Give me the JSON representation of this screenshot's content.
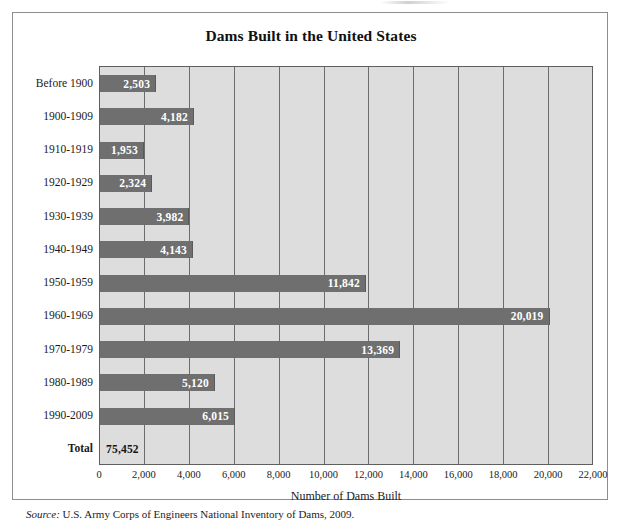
{
  "figure": {
    "title": "Dams Built in the United States",
    "source_label": "Source:",
    "source_text": "U.S. Army Corps of Engineers National Inventory of Dams, 2009."
  },
  "colors": {
    "bar_fill": "#6f6f6f",
    "plot_background": "#dddddd",
    "gridline": "#6c6c6c",
    "border": "#8d8d8d",
    "value_label": "#ffffff",
    "total_label": "#121212"
  },
  "chart_data": {
    "type": "bar",
    "orientation": "horizontal",
    "title": "Dams Built in the United States",
    "xlabel": "Number of Dams Built",
    "ylabel": "",
    "xlim": [
      0,
      22000
    ],
    "xticks": [
      0,
      2000,
      4000,
      6000,
      8000,
      10000,
      12000,
      14000,
      16000,
      18000,
      20000,
      22000
    ],
    "xtick_labels": [
      "0",
      "2,000",
      "4,000",
      "6,000",
      "8,000",
      "10,000",
      "12,000",
      "14,000",
      "16,000",
      "18,000",
      "20,000",
      "22,000"
    ],
    "grid": "vertical",
    "legend": "none",
    "categories": [
      "Before 1900",
      "1900-1909",
      "1910-1919",
      "1920-1929",
      "1930-1939",
      "1940-1949",
      "1950-1959",
      "1960-1969",
      "1970-1979",
      "1980-1989",
      "1990-2009",
      "Total"
    ],
    "values": [
      2503,
      4182,
      1953,
      2324,
      3982,
      4143,
      11842,
      20019,
      13369,
      5120,
      6015,
      75452
    ],
    "value_labels": [
      "2,503",
      "4,182",
      "1,953",
      "2,324",
      "3,982",
      "4,143",
      "11,842",
      "20,019",
      "13,369",
      "5,120",
      "6,015",
      "75,452"
    ],
    "bars": [
      {
        "category": "Before 1900",
        "value": 2503,
        "label": "2,503",
        "drawn": true
      },
      {
        "category": "1900-1909",
        "value": 4182,
        "label": "4,182",
        "drawn": true
      },
      {
        "category": "1910-1919",
        "value": 1953,
        "label": "1,953",
        "drawn": true
      },
      {
        "category": "1920-1929",
        "value": 2324,
        "label": "2,324",
        "drawn": true
      },
      {
        "category": "1930-1939",
        "value": 3982,
        "label": "3,982",
        "drawn": true
      },
      {
        "category": "1940-1949",
        "value": 4143,
        "label": "4,143",
        "drawn": true
      },
      {
        "category": "1950-1959",
        "value": 11842,
        "label": "11,842",
        "drawn": true
      },
      {
        "category": "1960-1969",
        "value": 20019,
        "label": "20,019",
        "drawn": true
      },
      {
        "category": "1970-1979",
        "value": 13369,
        "label": "13,369",
        "drawn": true
      },
      {
        "category": "1980-1989",
        "value": 5120,
        "label": "5,120",
        "drawn": true
      },
      {
        "category": "1990-2009",
        "value": 6015,
        "label": "6,015",
        "drawn": true
      },
      {
        "category": "Total",
        "value": 75452,
        "label": "75,452",
        "drawn": false
      }
    ]
  }
}
